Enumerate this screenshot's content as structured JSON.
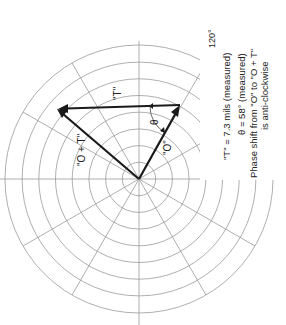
{
  "diagram": {
    "type": "polar-vector-diagram",
    "orientation": "rotated-90-ccw",
    "grid": {
      "rings": 8,
      "spoke_interval_deg": 30,
      "angle_label": "120°"
    },
    "vectors": [
      {
        "id": "O",
        "label": "\"O\""
      },
      {
        "id": "T",
        "label": "\"T\""
      },
      {
        "id": "O_plus_T",
        "label": "\"O + T\""
      }
    ],
    "angle": {
      "symbol": "θ"
    },
    "annotations": {
      "line1": "\"T\" = 7.3 mils (measured)",
      "line2": "θ = 58°  (measured)",
      "line3": "Phase shift from \"O\" to \"O + T\"",
      "line4": "is anti-clockwise"
    },
    "colors": {
      "grid": "#9a9a9a",
      "vector": "#1a1a1a",
      "text": "#222222",
      "background": "#ffffff"
    }
  }
}
